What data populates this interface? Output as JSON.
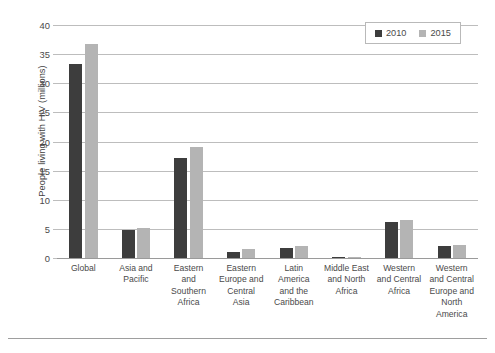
{
  "chart_data": {
    "type": "bar",
    "title": "",
    "xlabel": "",
    "ylabel": "People living with HIV (millions)",
    "ylim": [
      0,
      40
    ],
    "ytick_step": 5,
    "yticks": [
      "0",
      "5",
      "10",
      "15",
      "20",
      "25",
      "30",
      "35",
      "40"
    ],
    "grid": true,
    "legend_position": "top-right",
    "categories": [
      "Global",
      "Asia and Pacific",
      "Eastern and Southern Africa",
      "Eastern Europe and Central Asia",
      "Latin America and the Caribbean",
      "Middle East and North Africa",
      "Western and Central Africa",
      "Western and Central Europe and North America"
    ],
    "category_lines": [
      [
        "Global"
      ],
      [
        "Asia and",
        "Pacific"
      ],
      [
        "Eastern",
        "and",
        "Southern",
        "Africa"
      ],
      [
        "Eastern",
        "Europe and",
        "Central",
        "Asia"
      ],
      [
        "Latin",
        "America",
        "and the",
        "Caribbean"
      ],
      [
        "Middle East",
        "and North",
        "Africa"
      ],
      [
        "Western",
        "and Central",
        "Africa"
      ],
      [
        "Western",
        "and Central",
        "Europe and",
        "North",
        "America"
      ]
    ],
    "series": [
      {
        "name": "2010",
        "color": "#3d3d3d",
        "values": [
          33.3,
          4.8,
          17.2,
          1.0,
          1.8,
          0.2,
          6.1,
          2.0
        ]
      },
      {
        "name": "2015",
        "color": "#b4b4b4",
        "values": [
          36.7,
          5.1,
          19.1,
          1.5,
          2.0,
          0.25,
          6.5,
          2.3
        ]
      }
    ]
  },
  "legend": {
    "entries": [
      {
        "label": "2010",
        "swatch": "legend-swatch-2010"
      },
      {
        "label": "2015",
        "swatch": "legend-swatch-2015"
      }
    ]
  },
  "colors": {
    "series_2010": "#3d3d3d",
    "series_2015": "#b4b4b4",
    "gridline": "#bdbdbd",
    "axis": "#9a9a9a",
    "text": "#4a4a4a"
  }
}
